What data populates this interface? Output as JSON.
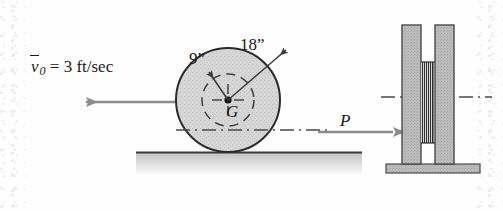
{
  "figure": {
    "background_color": "#fefefe"
  },
  "labels": {
    "velocity_symbol": "v",
    "velocity_subscript": "0",
    "velocity_equation": " = 3 ft/sec",
    "velocity_full": "v̄0 = 3 ft/sec",
    "inner_radius": "9”",
    "outer_radius": "18”",
    "center_of_mass": "G",
    "force": "P"
  },
  "colors": {
    "wheel_fill": "#d4d4d4",
    "wheel_stroke": "#2b2b2b",
    "arrow_gray": "#8c8c8c",
    "bar_fill": "#b8b8b8",
    "bar_stroke": "#4a4a4a",
    "ground_line": "#3a3a3a",
    "ground_shade": "#c9c9c9",
    "dash_line": "#4a4a4a",
    "text": "#1a1a1a"
  },
  "geometry": {
    "wheel_center_x": 228,
    "wheel_center_y": 100,
    "wheel_outer_radius_px": 52,
    "wheel_inner_radius_px": 26,
    "ground_y": 152,
    "centerline_y": 130,
    "spool_centerline_y": 97
  },
  "arrows": {
    "velocity_direction": "left",
    "force_direction": "right"
  },
  "side_view": {
    "description": "End view of spool: two flanges with cord wound between",
    "left_flange": true,
    "right_flange": true,
    "cord_wrap": true,
    "base_plate": true
  }
}
